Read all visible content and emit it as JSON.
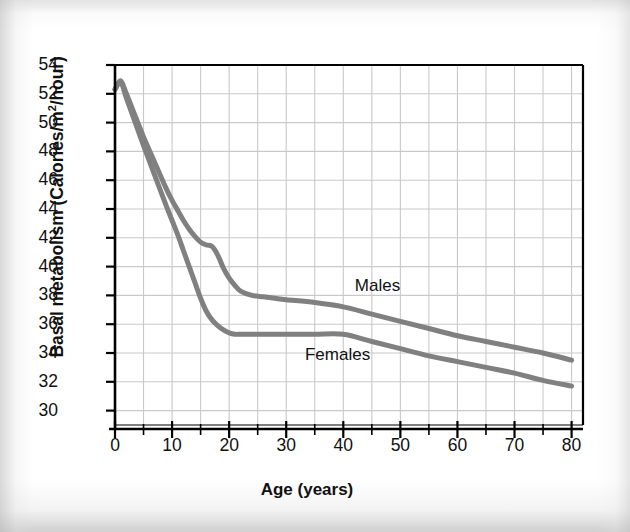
{
  "chart_data": {
    "type": "line",
    "title": "",
    "xlabel": "Age (years)",
    "ylabel": "Basal metabolism (Calories/m²/hour)",
    "ylabel_main": "Basal metabolism (Calories/m",
    "ylabel_sup": "2",
    "ylabel_tail": "/hour)",
    "xlim": [
      0,
      82
    ],
    "ylim": [
      29,
      54
    ],
    "grid": true,
    "grid_color": "#c9c9c9",
    "legend_position": "inline-annotations",
    "line_color": "#808080",
    "axis_color": "#000000",
    "xticks": [
      0,
      10,
      20,
      30,
      40,
      50,
      60,
      70,
      80
    ],
    "xminor_step": 5,
    "yticks": [
      30,
      32,
      34,
      36,
      38,
      40,
      42,
      44,
      46,
      48,
      50,
      52,
      54
    ],
    "x": [
      0,
      1,
      2,
      3,
      5,
      7,
      9,
      10,
      11,
      12,
      13,
      14,
      15,
      16,
      17,
      18,
      19,
      20,
      21,
      22,
      24,
      26,
      28,
      30,
      35,
      40,
      45,
      50,
      55,
      60,
      65,
      70,
      75,
      80
    ],
    "series": [
      {
        "name": "Males",
        "label": "Males",
        "color": "#808080",
        "values": [
          52.3,
          52.9,
          52.0,
          51.0,
          49.0,
          47.2,
          45.4,
          44.6,
          43.9,
          43.2,
          42.6,
          42.1,
          41.7,
          41.5,
          41.4,
          40.8,
          39.9,
          39.2,
          38.7,
          38.3,
          38.0,
          37.9,
          37.8,
          37.7,
          37.5,
          37.2,
          36.7,
          36.2,
          35.7,
          35.2,
          34.8,
          34.4,
          34.0,
          33.5
        ]
      },
      {
        "name": "Females",
        "label": "Females",
        "color": "#808080",
        "values": [
          52.3,
          52.8,
          51.7,
          50.6,
          48.4,
          46.3,
          44.2,
          43.2,
          42.2,
          41.1,
          40.0,
          38.9,
          37.8,
          36.9,
          36.3,
          35.9,
          35.6,
          35.4,
          35.3,
          35.3,
          35.3,
          35.3,
          35.3,
          35.3,
          35.3,
          35.3,
          34.8,
          34.3,
          33.8,
          33.4,
          33.0,
          32.6,
          32.1,
          31.7
        ]
      }
    ],
    "annotations": [
      {
        "text": "Males",
        "x": 46,
        "y": 38.6
      },
      {
        "text": "Females",
        "x": 39,
        "y": 33.8
      }
    ]
  }
}
